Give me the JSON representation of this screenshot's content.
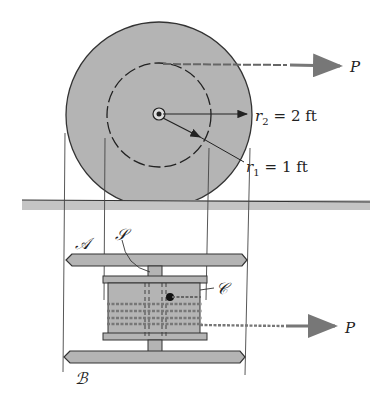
{
  "diagram": {
    "type": "engineering mechanics figure - wheel with hub pulled by cable",
    "labels": {
      "force_top": "P",
      "force_bottom": "P",
      "r2_symbol": "r",
      "r2_sub": "2",
      "r2_value": "= 2 ft",
      "r1_symbol": "r",
      "r1_sub": "1",
      "r1_value": "= 1 ft",
      "wheel_A": "𝒜",
      "wheel_B": "ℬ",
      "shaft_S": "𝒮",
      "hub_C": "𝒞"
    },
    "colors": {
      "disk_fill": "#b4b4b4",
      "outline": "#333333",
      "ground": "#c0c0c0",
      "cable": "#888888",
      "arrow": "#777777"
    }
  }
}
